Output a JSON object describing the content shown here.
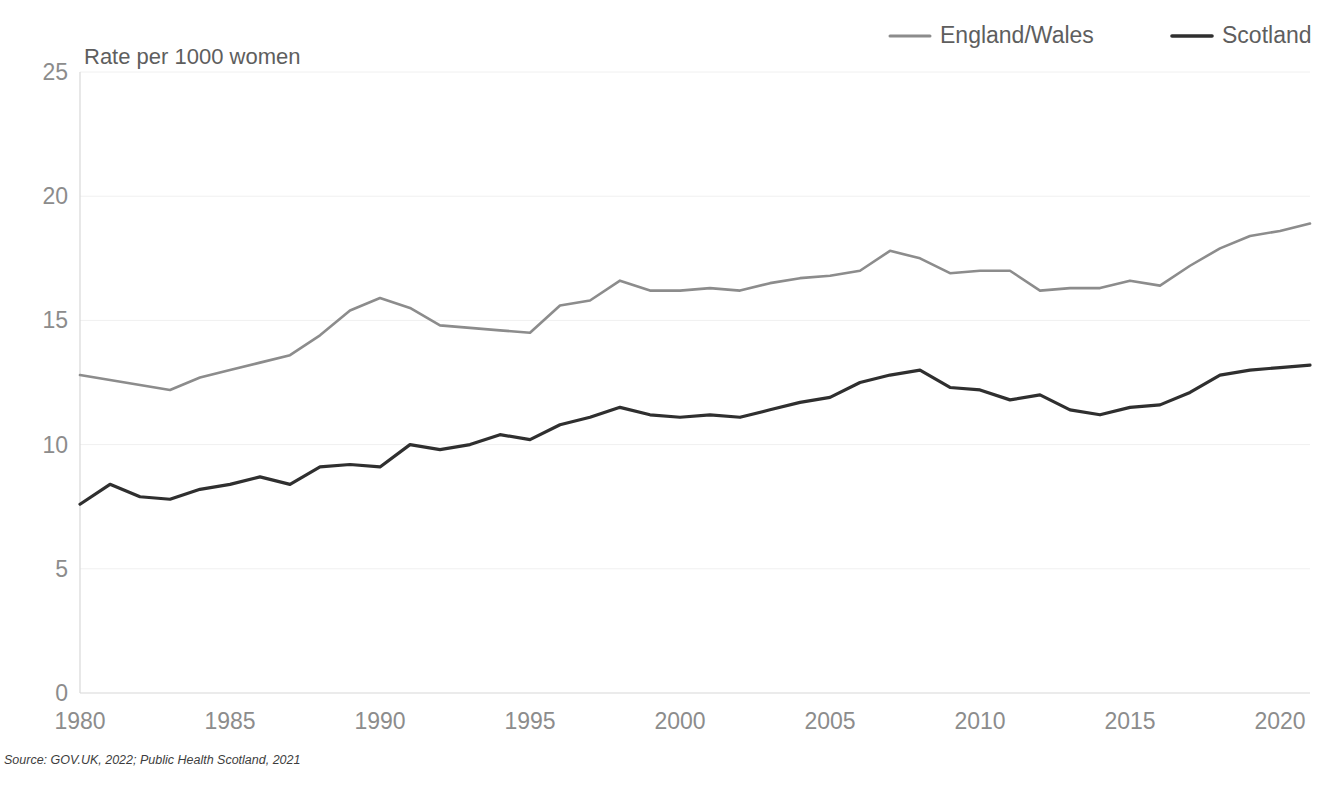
{
  "chart_data": {
    "type": "line",
    "title": "",
    "ylabel": "Rate per 1000 women",
    "xlabel": "",
    "ylim": [
      0,
      25
    ],
    "xlim": [
      1980,
      2021
    ],
    "yticks": [
      0,
      5,
      10,
      15,
      20,
      25
    ],
    "xticks": [
      1980,
      1985,
      1990,
      1995,
      2000,
      2005,
      2010,
      2015,
      2020
    ],
    "grid": true,
    "legend_position": "top-right",
    "x": [
      1980,
      1981,
      1982,
      1983,
      1984,
      1985,
      1986,
      1987,
      1988,
      1989,
      1990,
      1991,
      1992,
      1993,
      1994,
      1995,
      1996,
      1997,
      1998,
      1999,
      2000,
      2001,
      2002,
      2003,
      2004,
      2005,
      2006,
      2007,
      2008,
      2009,
      2010,
      2011,
      2012,
      2013,
      2014,
      2015,
      2016,
      2017,
      2018,
      2019,
      2020,
      2021
    ],
    "series": [
      {
        "name": "England/Wales",
        "color": "#8c8c8c",
        "values": [
          12.8,
          12.6,
          12.4,
          12.2,
          12.7,
          13.0,
          13.3,
          13.6,
          14.4,
          15.4,
          15.9,
          15.5,
          14.8,
          14.7,
          14.6,
          14.5,
          15.6,
          15.8,
          16.6,
          16.2,
          16.2,
          16.3,
          16.2,
          16.5,
          16.7,
          16.8,
          17.0,
          17.8,
          17.5,
          16.9,
          17.0,
          17.0,
          16.2,
          16.3,
          16.3,
          16.6,
          16.4,
          17.2,
          17.9,
          18.4,
          18.6,
          18.9
        ]
      },
      {
        "name": "Scotland",
        "color": "#2f2f2f",
        "values": [
          7.6,
          8.4,
          7.9,
          7.8,
          8.2,
          8.4,
          8.7,
          8.4,
          9.1,
          9.2,
          9.1,
          10.0,
          9.8,
          10.0,
          10.4,
          10.2,
          10.8,
          11.1,
          11.5,
          11.2,
          11.1,
          11.2,
          11.1,
          11.4,
          11.7,
          11.9,
          12.5,
          12.8,
          13.0,
          12.3,
          12.2,
          11.8,
          12.0,
          11.4,
          11.2,
          11.5,
          11.6,
          12.1,
          12.8,
          13.0,
          13.1,
          13.2
        ]
      }
    ]
  },
  "legend": {
    "items": [
      {
        "label": "England/Wales"
      },
      {
        "label": "Scotland"
      }
    ]
  },
  "axis": {
    "y_title": "Rate per 1000 women"
  },
  "footer": {
    "source": "Source: GOV.UK, 2022; Public Health Scotland, 2021"
  }
}
